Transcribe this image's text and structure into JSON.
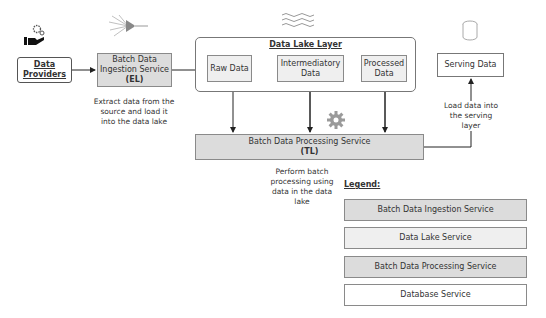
{
  "diagram": {
    "data_providers": {
      "label_line1": "Data",
      "label_line2": "Providers"
    },
    "ingestion": {
      "line1": "Batch Data",
      "line2": "Ingestion Service",
      "tag": "(EL)",
      "note_line1": "Extract data from the",
      "note_line2": "source and load it",
      "note_line3": "into the data lake"
    },
    "data_lake": {
      "title": "Data Lake Layer",
      "raw": "Raw Data",
      "intermediate_line1": "Intermediatory",
      "intermediate_line2": "Data",
      "processed_line1": "Processed",
      "processed_line2": "Data"
    },
    "processing": {
      "line1": "Batch Data Processing Service",
      "tag": "(TL)",
      "note_line1": "Perform batch",
      "note_line2": "processing using",
      "note_line3": "data in the data",
      "note_line4": "lake"
    },
    "serving": {
      "label": "Serving Data",
      "note_line1": "Load data into",
      "note_line2": "the serving",
      "note_line3": "layer"
    },
    "legend": {
      "title": "Legend:",
      "items": [
        {
          "label": "Batch Data Ingestion Service",
          "color": "#dcdcdc"
        },
        {
          "label": "Data Lake Service",
          "color": "#efefef"
        },
        {
          "label": "Batch Data Processing Service",
          "color": "#dcdcdc"
        },
        {
          "label": "Database Service",
          "color": "#ffffff"
        }
      ]
    },
    "icons": [
      "hand-gears-icon",
      "fiber-funnel-icon",
      "water-waves-icon",
      "gear-icon",
      "database-cylinder-icon"
    ]
  }
}
